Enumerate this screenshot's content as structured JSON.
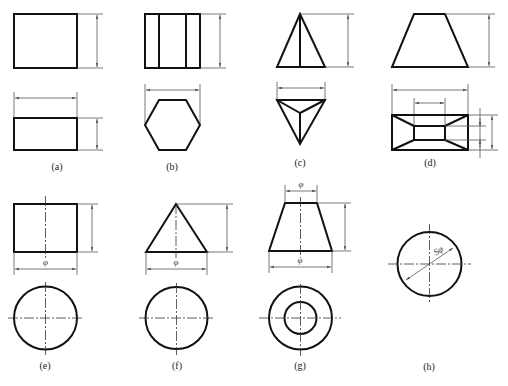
{
  "figure": {
    "panels": [
      {
        "id": "a",
        "label": "(a)",
        "solid": "rectangular prism",
        "views": [
          "front",
          "top"
        ]
      },
      {
        "id": "b",
        "label": "(b)",
        "solid": "hexagonal prism",
        "views": [
          "front",
          "top"
        ]
      },
      {
        "id": "c",
        "label": "(c)",
        "solid": "triangular pyramid",
        "views": [
          "front",
          "top"
        ]
      },
      {
        "id": "d",
        "label": "(d)",
        "solid": "truncated rectangular pyramid (frustum)",
        "views": [
          "front",
          "top"
        ]
      },
      {
        "id": "e",
        "label": "(e)",
        "solid": "cylinder",
        "views": [
          "front",
          "top"
        ],
        "dim_symbol": "φ"
      },
      {
        "id": "f",
        "label": "(f)",
        "solid": "cone",
        "views": [
          "front",
          "top"
        ],
        "dim_symbol": "φ"
      },
      {
        "id": "g",
        "label": "(g)",
        "solid": "truncated cone (frustum)",
        "views": [
          "front",
          "top"
        ],
        "dim_symbols": [
          "φ",
          "φ"
        ]
      },
      {
        "id": "h",
        "label": "(h)",
        "solid": "sphere",
        "views": [
          "single"
        ],
        "dim_symbol": "Sφ"
      }
    ]
  },
  "labels": {
    "a": "(a)",
    "b": "(b)",
    "c": "(c)",
    "d": "(d)",
    "e": "(e)",
    "f": "(f)",
    "g": "(g)",
    "h": "(h)"
  },
  "symbols": {
    "phi": "φ",
    "sphere_phi": "Sφ"
  },
  "colors": {
    "outline": "#111111",
    "dimension": "#555555",
    "background": "#ffffff"
  }
}
